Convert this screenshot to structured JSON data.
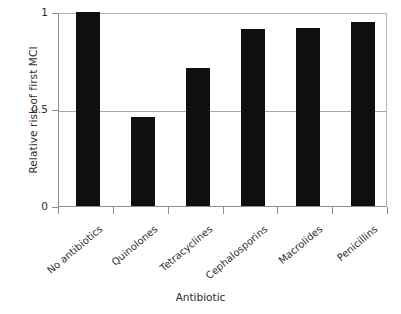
{
  "chart_data": {
    "type": "bar",
    "title": "",
    "subtitle": "",
    "xlabel": "Antibiotic",
    "ylabel": "Relative risk of first MCI",
    "categories": [
      "No antibiotics",
      "Quinolones",
      "Tetracyclines",
      "Cephalosporins",
      "Macrolides",
      "Penicillins"
    ],
    "values": [
      1.0,
      0.46,
      0.71,
      0.91,
      0.92,
      0.95
    ],
    "series": [
      {
        "name": "Relative risk of first MCI",
        "values": [
          1.0,
          0.46,
          0.71,
          0.91,
          0.92,
          0.95
        ]
      }
    ],
    "ylim": [
      0,
      1
    ],
    "xlim_categories": 6,
    "ytick_labels": [
      "0",
      "0.5",
      "1"
    ],
    "ytick_values": [
      0,
      0.5,
      1
    ],
    "grid": "horizontal",
    "gridlines_at": [
      0.5,
      1.0
    ],
    "legend": "none",
    "bar_color": "#100f0f",
    "axis_color": "#8d8d8d",
    "grid_color": "#a8a8a8",
    "background_color": "#ffffff",
    "orientation": "vertical",
    "annotations": []
  },
  "axes": {
    "y": {
      "title": "Relative risk of first MCI",
      "ticks": [
        {
          "label": "1",
          "value": 1.0
        },
        {
          "label": "0.5",
          "value": 0.5
        },
        {
          "label": "0",
          "value": 0.0
        }
      ]
    },
    "x": {
      "title": "Antibiotic",
      "ticks": [
        {
          "label": "No antibiotics"
        },
        {
          "label": "Quinolones"
        },
        {
          "label": "Tetracyclines"
        },
        {
          "label": "Cephalosporins"
        },
        {
          "label": "Macrolides"
        },
        {
          "label": "Penicillins"
        }
      ]
    }
  }
}
